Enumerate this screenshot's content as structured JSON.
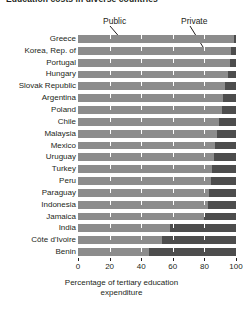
{
  "title": "Education costs in diverse countries",
  "legend": {
    "public_label": "Public",
    "private_label": "Private",
    "position": "above-plot"
  },
  "axis": {
    "x_title_line1": "Percentage of tertiary education",
    "x_title_line2": "expenditure",
    "ticks": [
      "0",
      "20",
      "40",
      "60",
      "80",
      "100"
    ]
  },
  "colors": {
    "public": "#8c8c8c",
    "private": "#4d4d4d",
    "text": "#231f20",
    "gridline": "#ffffff",
    "background": "#ffffff"
  },
  "chart_data": {
    "type": "bar",
    "orientation": "horizontal",
    "stacked": true,
    "normalized": true,
    "title": "Education costs in diverse countries",
    "xlabel": "Percentage of tertiary education expenditure",
    "ylabel": "",
    "xlim": [
      0,
      100
    ],
    "xticks": [
      0,
      20,
      40,
      60,
      80,
      100
    ],
    "grid": true,
    "legend_position": "top",
    "categories": [
      "Greece",
      "Korea, Rep. of",
      "Portugal",
      "Hungary",
      "Slovak Republic",
      "Argentina",
      "Poland",
      "Chile",
      "Malaysia",
      "Mexico",
      "Uruguay",
      "Turkey",
      "Peru",
      "Paraguay",
      "Indonesia",
      "Jamaica",
      "India",
      "Côte d'Ivoire",
      "Benin"
    ],
    "series": [
      {
        "name": "Public",
        "values": [
          99,
          97,
          96,
          95,
          93,
          92,
          91,
          89,
          88,
          87,
          86,
          85,
          84,
          83,
          82,
          80,
          58,
          53,
          45
        ]
      },
      {
        "name": "Private",
        "values": [
          1,
          3,
          4,
          5,
          7,
          8,
          9,
          11,
          12,
          13,
          14,
          15,
          16,
          17,
          18,
          20,
          42,
          47,
          55
        ]
      }
    ]
  }
}
